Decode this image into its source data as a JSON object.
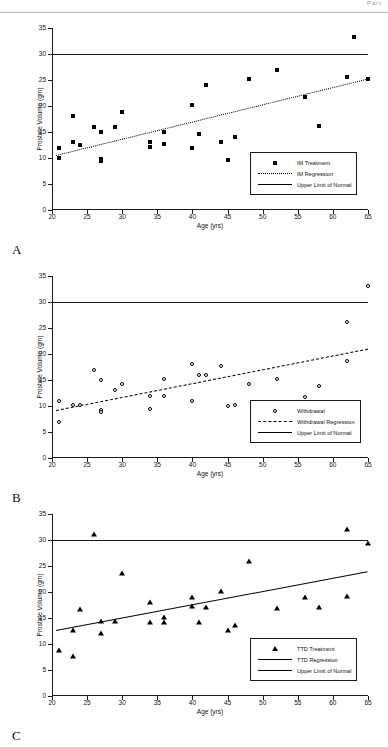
{
  "header": {
    "fragment": "Part"
  },
  "axes": {
    "ylabel": "Prostate Volume (gm)",
    "xlabel": "Age (yrs)",
    "yticks": [
      0,
      5,
      10,
      15,
      20,
      25,
      30,
      35
    ],
    "xticks": [
      20,
      25,
      30,
      35,
      40,
      45,
      50,
      55,
      60,
      65
    ]
  },
  "panels": [
    {
      "letter": "A",
      "legend": [
        {
          "key": "square",
          "label": "IM Treatment"
        },
        {
          "key": "dotted",
          "label": "IM Regression"
        },
        {
          "key": "solid",
          "label": "Upper Limit of Normal"
        }
      ]
    },
    {
      "letter": "B",
      "legend": [
        {
          "key": "circle",
          "label": "Withdrawal"
        },
        {
          "key": "dashed",
          "label": "Withdrawal Regression"
        },
        {
          "key": "solid",
          "label": "Upper Limit of Normal"
        }
      ]
    },
    {
      "letter": "C",
      "legend": [
        {
          "key": "triangle",
          "label": "TTD Treatment"
        },
        {
          "key": "solid",
          "label": "TTD Regression"
        },
        {
          "key": "solid",
          "label": "Upper Limit of Normal"
        }
      ]
    }
  ],
  "chart_data": [
    {
      "type": "scatter",
      "panel": "A",
      "title": "IM Treatment",
      "xlabel": "Age (yrs)",
      "ylabel": "Prostate Volume (gm)",
      "xlim": [
        20,
        65
      ],
      "ylim": [
        0,
        35
      ],
      "grid": false,
      "legend_position": "bottom-right",
      "marker": "filled-square",
      "points": [
        {
          "x": 21,
          "y": 12.0
        },
        {
          "x": 21,
          "y": 10.0
        },
        {
          "x": 23,
          "y": 18.0
        },
        {
          "x": 23,
          "y": 13.0
        },
        {
          "x": 24,
          "y": 12.5
        },
        {
          "x": 26,
          "y": 16.0
        },
        {
          "x": 27,
          "y": 15.0
        },
        {
          "x": 27,
          "y": 9.8
        },
        {
          "x": 27,
          "y": 9.4
        },
        {
          "x": 29,
          "y": 16.0
        },
        {
          "x": 30,
          "y": 18.8
        },
        {
          "x": 34,
          "y": 13.1
        },
        {
          "x": 34,
          "y": 12.1
        },
        {
          "x": 36,
          "y": 15.0
        },
        {
          "x": 36,
          "y": 12.6
        },
        {
          "x": 40,
          "y": 20.1
        },
        {
          "x": 40,
          "y": 12.0
        },
        {
          "x": 41,
          "y": 14.6
        },
        {
          "x": 42,
          "y": 24.0
        },
        {
          "x": 44,
          "y": 13.1
        },
        {
          "x": 45,
          "y": 9.6
        },
        {
          "x": 46,
          "y": 14.1
        },
        {
          "x": 48,
          "y": 25.1
        },
        {
          "x": 52,
          "y": 26.9
        },
        {
          "x": 56,
          "y": 21.8
        },
        {
          "x": 58,
          "y": 16.1
        },
        {
          "x": 62,
          "y": 25.6
        },
        {
          "x": 63,
          "y": 33.2
        },
        {
          "x": 65,
          "y": 25.2
        }
      ],
      "regression": {
        "style": "dotted",
        "x0": 20.6,
        "y0": 10.6,
        "x1": 65,
        "y1": 25.3
      },
      "reference_line": {
        "label": "Upper Limit of Normal",
        "y": 30,
        "style": "solid"
      }
    },
    {
      "type": "scatter",
      "panel": "B",
      "title": "Withdrawal",
      "xlabel": "Age (yrs)",
      "ylabel": "Prostate Volume (gm)",
      "xlim": [
        20,
        65
      ],
      "ylim": [
        0,
        35
      ],
      "grid": false,
      "legend_position": "bottom-right",
      "marker": "open-circle",
      "points": [
        {
          "x": 21,
          "y": 11.0
        },
        {
          "x": 21,
          "y": 7.0
        },
        {
          "x": 23,
          "y": 10.1
        },
        {
          "x": 24,
          "y": 10.2
        },
        {
          "x": 26,
          "y": 16.9
        },
        {
          "x": 27,
          "y": 15.0
        },
        {
          "x": 27,
          "y": 9.3
        },
        {
          "x": 27,
          "y": 8.9
        },
        {
          "x": 29,
          "y": 13.0
        },
        {
          "x": 30,
          "y": 14.3
        },
        {
          "x": 34,
          "y": 12.0
        },
        {
          "x": 34,
          "y": 9.5
        },
        {
          "x": 36,
          "y": 15.1
        },
        {
          "x": 36,
          "y": 12.0
        },
        {
          "x": 40,
          "y": 18.0
        },
        {
          "x": 40,
          "y": 11.0
        },
        {
          "x": 41,
          "y": 16.0
        },
        {
          "x": 42,
          "y": 16.0
        },
        {
          "x": 44,
          "y": 17.7
        },
        {
          "x": 45,
          "y": 10.0
        },
        {
          "x": 46,
          "y": 10.1
        },
        {
          "x": 48,
          "y": 14.2
        },
        {
          "x": 52,
          "y": 15.1
        },
        {
          "x": 56,
          "y": 11.7
        },
        {
          "x": 58,
          "y": 13.8
        },
        {
          "x": 62,
          "y": 18.6
        },
        {
          "x": 62,
          "y": 26.2
        },
        {
          "x": 65,
          "y": 33.1
        }
      ],
      "regression": {
        "style": "dashed",
        "x0": 20.6,
        "y0": 9.2,
        "x1": 65,
        "y1": 21.0
      },
      "reference_line": {
        "label": "Upper Limit of Normal",
        "y": 30,
        "style": "solid"
      }
    },
    {
      "type": "scatter",
      "panel": "C",
      "title": "TTD Treatment",
      "xlabel": "Age (yrs)",
      "ylabel": "Prostate Volume (gm)",
      "xlim": [
        20,
        65
      ],
      "ylim": [
        0,
        35
      ],
      "grid": false,
      "legend_position": "bottom-right",
      "marker": "filled-triangle",
      "points": [
        {
          "x": 21,
          "y": 8.8
        },
        {
          "x": 23,
          "y": 12.7
        },
        {
          "x": 23,
          "y": 7.7
        },
        {
          "x": 24,
          "y": 16.8
        },
        {
          "x": 26,
          "y": 31.2
        },
        {
          "x": 27,
          "y": 14.5
        },
        {
          "x": 27,
          "y": 12.1
        },
        {
          "x": 29,
          "y": 14.4
        },
        {
          "x": 30,
          "y": 23.7
        },
        {
          "x": 34,
          "y": 18.0
        },
        {
          "x": 34,
          "y": 14.2
        },
        {
          "x": 36,
          "y": 15.1
        },
        {
          "x": 36,
          "y": 14.2
        },
        {
          "x": 40,
          "y": 19.0
        },
        {
          "x": 40,
          "y": 17.3
        },
        {
          "x": 41,
          "y": 14.3
        },
        {
          "x": 42,
          "y": 17.2
        },
        {
          "x": 44,
          "y": 20.1
        },
        {
          "x": 45,
          "y": 12.7
        },
        {
          "x": 46,
          "y": 13.6
        },
        {
          "x": 48,
          "y": 25.9
        },
        {
          "x": 52,
          "y": 17.0
        },
        {
          "x": 56,
          "y": 19.1
        },
        {
          "x": 58,
          "y": 17.2
        },
        {
          "x": 62,
          "y": 19.3
        },
        {
          "x": 62,
          "y": 32.2
        },
        {
          "x": 65,
          "y": 29.4
        }
      ],
      "regression": {
        "style": "solid",
        "x0": 20.6,
        "y0": 12.7,
        "x1": 65,
        "y1": 24.0
      },
      "reference_line": {
        "label": "Upper Limit of Normal",
        "y": 30,
        "style": "solid"
      }
    }
  ]
}
